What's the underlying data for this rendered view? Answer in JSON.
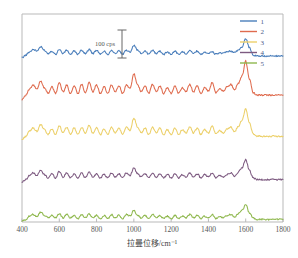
{
  "figure": {
    "background_color": "#ffffff",
    "axis_color": "#b9b9b9"
  },
  "annotation": {
    "scale_bar_label": "100 cps",
    "scale_bar_name": "intensity-scale-bar"
  },
  "legend": {
    "position": "top-right",
    "entries": [
      {
        "label": "1",
        "color": "#4a7ebb"
      },
      {
        "label": "2",
        "color": "#df6b4e"
      },
      {
        "label": "3",
        "color": "#ecd06a"
      },
      {
        "label": "4",
        "color": "#7d5a80"
      },
      {
        "label": "5",
        "color": "#8fb84e"
      }
    ]
  },
  "chart_data": {
    "type": "line",
    "title": "",
    "subtitle": "",
    "xlabel": "拉曼位移/cm⁻¹",
    "ylabel": "",
    "xlim": [
      400,
      1800
    ],
    "ylim": [
      0,
      5
    ],
    "xticks": [
      400,
      600,
      800,
      1000,
      1200,
      1400,
      1600,
      1800
    ],
    "xtick_labels": [
      "400",
      "600",
      "800",
      "1000",
      "1200",
      "1400",
      "1600",
      "1800"
    ],
    "yticks": [],
    "ytick_labels": [],
    "grid": false,
    "legend_position": "upper right",
    "annotations": [
      {
        "text": "100 cps",
        "x": 850,
        "y": 4.55,
        "kind": "scale-bar-label"
      }
    ],
    "series": [
      {
        "name": "1",
        "color": "#4a7ebb",
        "offset": 3.95,
        "x": [
          400,
          420,
          440,
          460,
          480,
          500,
          520,
          540,
          560,
          580,
          600,
          620,
          640,
          660,
          680,
          700,
          720,
          740,
          760,
          780,
          800,
          820,
          840,
          860,
          880,
          900,
          920,
          940,
          960,
          980,
          1000,
          1020,
          1040,
          1060,
          1080,
          1100,
          1120,
          1140,
          1160,
          1180,
          1200,
          1220,
          1240,
          1260,
          1280,
          1300,
          1320,
          1340,
          1360,
          1380,
          1400,
          1420,
          1440,
          1460,
          1480,
          1500,
          1520,
          1540,
          1560,
          1580,
          1600,
          1620,
          1640,
          1660,
          1680,
          1700,
          1720,
          1740,
          1760,
          1780,
          1800
        ],
        "values": [
          0.0,
          0.06,
          0.14,
          0.2,
          0.16,
          0.26,
          0.18,
          0.1,
          0.16,
          0.08,
          0.2,
          0.1,
          0.18,
          0.08,
          0.16,
          0.08,
          0.18,
          0.1,
          0.2,
          0.1,
          0.18,
          0.08,
          0.16,
          0.08,
          0.18,
          0.1,
          0.16,
          0.08,
          0.18,
          0.14,
          0.3,
          0.18,
          0.1,
          0.16,
          0.08,
          0.18,
          0.1,
          0.16,
          0.08,
          0.14,
          0.08,
          0.16,
          0.08,
          0.14,
          0.1,
          0.18,
          0.1,
          0.16,
          0.08,
          0.14,
          0.1,
          0.14,
          0.08,
          0.12,
          0.1,
          0.14,
          0.16,
          0.12,
          0.18,
          0.26,
          0.46,
          0.24,
          0.06,
          0.04,
          0.04,
          0.04,
          0.04,
          0.04,
          0.04,
          0.04,
          0.04
        ]
      },
      {
        "name": "2",
        "color": "#df6b4e",
        "offset": 2.95,
        "x": [
          400,
          420,
          440,
          460,
          480,
          500,
          520,
          540,
          560,
          580,
          600,
          620,
          640,
          660,
          680,
          700,
          720,
          740,
          760,
          780,
          800,
          820,
          840,
          860,
          880,
          900,
          920,
          940,
          960,
          980,
          1000,
          1020,
          1040,
          1060,
          1080,
          1100,
          1120,
          1140,
          1160,
          1180,
          1200,
          1220,
          1240,
          1260,
          1280,
          1300,
          1320,
          1340,
          1360,
          1380,
          1400,
          1420,
          1440,
          1460,
          1480,
          1500,
          1520,
          1540,
          1560,
          1580,
          1600,
          1620,
          1640,
          1660,
          1680,
          1700,
          1720,
          1740,
          1760,
          1780,
          1800
        ],
        "values": [
          0.0,
          0.1,
          0.24,
          0.34,
          0.24,
          0.44,
          0.28,
          0.14,
          0.3,
          0.14,
          0.4,
          0.18,
          0.34,
          0.14,
          0.32,
          0.14,
          0.36,
          0.16,
          0.4,
          0.18,
          0.34,
          0.14,
          0.3,
          0.14,
          0.34,
          0.18,
          0.32,
          0.14,
          0.34,
          0.26,
          0.62,
          0.34,
          0.18,
          0.32,
          0.14,
          0.36,
          0.18,
          0.32,
          0.14,
          0.28,
          0.14,
          0.32,
          0.14,
          0.28,
          0.18,
          0.36,
          0.18,
          0.32,
          0.14,
          0.28,
          0.2,
          0.4,
          0.16,
          0.26,
          0.2,
          0.3,
          0.36,
          0.22,
          0.38,
          0.56,
          0.92,
          0.48,
          0.16,
          0.1,
          0.1,
          0.1,
          0.1,
          0.1,
          0.1,
          0.1,
          0.1
        ]
      },
      {
        "name": "3",
        "color": "#ecd06a",
        "offset": 1.98,
        "x": [
          400,
          420,
          440,
          460,
          480,
          500,
          520,
          540,
          560,
          580,
          600,
          620,
          640,
          660,
          680,
          700,
          720,
          740,
          760,
          780,
          800,
          820,
          840,
          860,
          880,
          900,
          920,
          940,
          960,
          980,
          1000,
          1020,
          1040,
          1060,
          1080,
          1100,
          1120,
          1140,
          1160,
          1180,
          1200,
          1220,
          1240,
          1260,
          1280,
          1300,
          1320,
          1340,
          1360,
          1380,
          1400,
          1420,
          1440,
          1460,
          1480,
          1500,
          1520,
          1540,
          1560,
          1580,
          1600,
          1620,
          1640,
          1660,
          1680,
          1700,
          1720,
          1740,
          1760,
          1780,
          1800
        ],
        "values": [
          0.0,
          0.08,
          0.2,
          0.28,
          0.2,
          0.36,
          0.24,
          0.12,
          0.26,
          0.12,
          0.34,
          0.16,
          0.3,
          0.12,
          0.28,
          0.12,
          0.3,
          0.14,
          0.34,
          0.16,
          0.28,
          0.12,
          0.26,
          0.12,
          0.3,
          0.16,
          0.28,
          0.12,
          0.3,
          0.22,
          0.52,
          0.3,
          0.16,
          0.28,
          0.12,
          0.3,
          0.16,
          0.28,
          0.12,
          0.24,
          0.12,
          0.28,
          0.12,
          0.24,
          0.16,
          0.3,
          0.16,
          0.28,
          0.12,
          0.24,
          0.16,
          0.32,
          0.14,
          0.22,
          0.16,
          0.26,
          0.3,
          0.18,
          0.32,
          0.46,
          0.74,
          0.4,
          0.14,
          0.08,
          0.08,
          0.08,
          0.08,
          0.08,
          0.08,
          0.08,
          0.08
        ]
      },
      {
        "name": "4",
        "color": "#7d5a80",
        "offset": 0.96,
        "x": [
          400,
          420,
          440,
          460,
          480,
          500,
          520,
          540,
          560,
          580,
          600,
          620,
          640,
          660,
          680,
          700,
          720,
          740,
          760,
          780,
          800,
          820,
          840,
          860,
          880,
          900,
          920,
          940,
          960,
          980,
          1000,
          1020,
          1040,
          1060,
          1080,
          1100,
          1120,
          1140,
          1160,
          1180,
          1200,
          1220,
          1240,
          1260,
          1280,
          1300,
          1320,
          1340,
          1360,
          1380,
          1400,
          1420,
          1440,
          1460,
          1480,
          1500,
          1520,
          1540,
          1560,
          1580,
          1600,
          1620,
          1640,
          1660,
          1680,
          1700,
          1720,
          1740,
          1760,
          1780,
          1800
        ],
        "values": [
          0.0,
          0.06,
          0.16,
          0.22,
          0.16,
          0.28,
          0.18,
          0.1,
          0.2,
          0.1,
          0.26,
          0.12,
          0.22,
          0.1,
          0.2,
          0.1,
          0.22,
          0.1,
          0.24,
          0.12,
          0.2,
          0.1,
          0.18,
          0.1,
          0.22,
          0.12,
          0.2,
          0.1,
          0.22,
          0.16,
          0.34,
          0.2,
          0.12,
          0.2,
          0.1,
          0.22,
          0.12,
          0.2,
          0.1,
          0.18,
          0.1,
          0.2,
          0.1,
          0.18,
          0.12,
          0.22,
          0.12,
          0.2,
          0.1,
          0.18,
          0.12,
          0.22,
          0.1,
          0.16,
          0.12,
          0.18,
          0.22,
          0.14,
          0.24,
          0.34,
          0.54,
          0.28,
          0.1,
          0.06,
          0.06,
          0.06,
          0.06,
          0.06,
          0.06,
          0.06,
          0.06
        ]
      },
      {
        "name": "5",
        "color": "#8fb84e",
        "offset": 0.02,
        "x": [
          400,
          420,
          440,
          460,
          480,
          500,
          520,
          540,
          560,
          580,
          600,
          620,
          640,
          660,
          680,
          700,
          720,
          740,
          760,
          780,
          800,
          820,
          840,
          860,
          880,
          900,
          920,
          940,
          960,
          980,
          1000,
          1020,
          1040,
          1060,
          1080,
          1100,
          1120,
          1140,
          1160,
          1180,
          1200,
          1220,
          1240,
          1260,
          1280,
          1300,
          1320,
          1340,
          1360,
          1380,
          1400,
          1420,
          1440,
          1460,
          1480,
          1500,
          1520,
          1540,
          1560,
          1580,
          1600,
          1620,
          1640,
          1660,
          1680,
          1700,
          1720,
          1740,
          1760,
          1780,
          1800
        ],
        "values": [
          0.0,
          0.04,
          0.12,
          0.16,
          0.12,
          0.22,
          0.14,
          0.08,
          0.14,
          0.08,
          0.18,
          0.08,
          0.16,
          0.08,
          0.14,
          0.06,
          0.16,
          0.08,
          0.18,
          0.08,
          0.14,
          0.06,
          0.14,
          0.06,
          0.16,
          0.08,
          0.14,
          0.06,
          0.16,
          0.12,
          0.26,
          0.14,
          0.08,
          0.14,
          0.06,
          0.16,
          0.08,
          0.14,
          0.06,
          0.12,
          0.06,
          0.14,
          0.06,
          0.12,
          0.08,
          0.16,
          0.08,
          0.14,
          0.06,
          0.12,
          0.08,
          0.16,
          0.06,
          0.12,
          0.08,
          0.14,
          0.16,
          0.1,
          0.18,
          0.26,
          0.4,
          0.2,
          0.08,
          0.04,
          0.04,
          0.04,
          0.04,
          0.04,
          0.04,
          0.04,
          0.04
        ]
      }
    ]
  }
}
